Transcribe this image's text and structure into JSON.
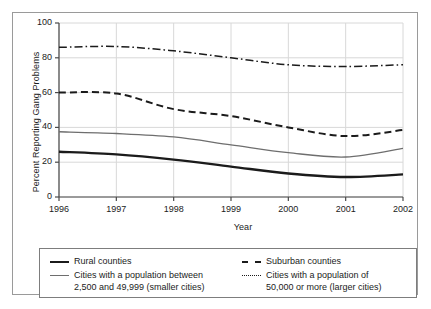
{
  "chart_data": {
    "type": "line",
    "title": "",
    "xlabel": "Year",
    "ylabel": "Percent Reporting Gang Problems",
    "x": [
      1996,
      1997,
      1998,
      1999,
      2000,
      2001,
      2002
    ],
    "xtick_labels": [
      "1996",
      "1997",
      "1998",
      "1999",
      "2000",
      "2001",
      "2002"
    ],
    "ytick_labels": [
      "0",
      "20",
      "40",
      "60",
      "80",
      "100"
    ],
    "ylim": [
      0,
      100
    ],
    "xlim": [
      1996,
      2002
    ],
    "ytick_values": [
      0,
      20,
      40,
      60,
      80,
      100
    ],
    "grid": true,
    "legend_position": "below-plot",
    "series": [
      {
        "name": "Rural counties",
        "style": "solid-thick",
        "color": "#1b1b1b",
        "values": [
          26.0,
          24.5,
          21.5,
          17.5,
          13.5,
          11.5,
          13.0
        ]
      },
      {
        "name": "Cities with a population between\n2,500 and 49,999 (smaller cities)",
        "style": "solid-thin",
        "color": "#6e6e6e",
        "values": [
          37.5,
          36.5,
          34.5,
          30.0,
          25.5,
          23.0,
          28.0
        ]
      },
      {
        "name": "Suburban counties",
        "style": "dashed",
        "color": "#1b1b1b",
        "values": [
          60.0,
          59.5,
          50.5,
          46.5,
          40.0,
          35.0,
          38.5
        ]
      },
      {
        "name": "Cities with a population of\n50,000 or more (larger cities)",
        "style": "dash-dot",
        "color": "#1b1b1b",
        "values": [
          86.0,
          86.5,
          84.0,
          80.0,
          76.0,
          75.0,
          76.0
        ]
      }
    ]
  },
  "axes": {
    "ylabel": "Percent Reporting Gang Problems",
    "xlabel": "Year",
    "yticks": [
      "100",
      "80",
      "60",
      "40",
      "20",
      "0"
    ],
    "xticks": [
      "1996",
      "1997",
      "1998",
      "1999",
      "2000",
      "2001",
      "2002"
    ]
  },
  "legend": {
    "left": [
      {
        "label": "Rural counties",
        "style": "solid-thick"
      },
      {
        "label": "Cities with a population between\n2,500 and 49,999 (smaller cities)",
        "style": "solid-thin"
      }
    ],
    "right": [
      {
        "label": "Suburban counties",
        "style": "dashed"
      },
      {
        "label": "Cities with a population of\n50,000 or more (larger cities)",
        "style": "dash-dot"
      }
    ]
  },
  "colors": {
    "line_dark": "#1b1b1b",
    "line_gray": "#6e6e6e",
    "grid": "#d8d8d8",
    "axis": "#4a4a4a",
    "frame": "#9a9a9a"
  }
}
